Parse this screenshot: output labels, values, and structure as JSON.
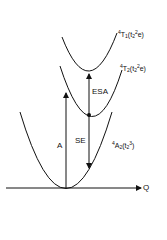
{
  "diagram": {
    "states": [
      {
        "id": "ground",
        "term": "4A2",
        "configuration": "t2^3",
        "label_sup": "4",
        "label_main": "A",
        "label_sub": "2",
        "cfg_main": "t",
        "cfg_sub": "2",
        "cfg_sup": "3"
      },
      {
        "id": "first-excited",
        "term": "4T2",
        "configuration": "t2^2 e",
        "label_sup": "4",
        "label_main": "T",
        "label_sub": "2",
        "cfg_main": "t",
        "cfg_sub": "2",
        "cfg_sup": "2",
        "cfg_tail": "e"
      },
      {
        "id": "second-excited",
        "term": "4T1",
        "configuration": "t2^2 e",
        "label_sup": "4",
        "label_main": "T",
        "label_sub": "1",
        "cfg_main": "t",
        "cfg_sub": "2",
        "cfg_sup": "2",
        "cfg_tail": "e"
      }
    ],
    "transitions": [
      {
        "id": "absorption",
        "label": "A"
      },
      {
        "id": "excited-state-absorption",
        "label": "ESA"
      },
      {
        "id": "stimulated-emission",
        "label": "SE"
      }
    ],
    "axis_label": "Q",
    "stroke_color": "#111111"
  }
}
